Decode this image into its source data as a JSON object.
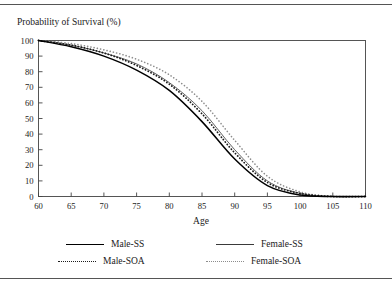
{
  "figure": {
    "title": "Probability of Survival (%)",
    "has_top_rule": true,
    "has_bottom_rule": true,
    "frame_color": "#555555"
  },
  "legend": {
    "position": "below-plot",
    "entries": [
      {
        "label": "Male-SS",
        "style": "solid-thick",
        "color": "#000000"
      },
      {
        "label": "Female-SS",
        "style": "solid-thin",
        "color": "#3a3a3a"
      },
      {
        "label": "Male-SOA",
        "style": "dotted-bold",
        "color": "#1c1c1c"
      },
      {
        "label": "Female-SOA",
        "style": "dotted-light",
        "color": "#8c8c8c"
      }
    ]
  },
  "chart_data": {
    "type": "line",
    "title": "Probability of Survival (%)",
    "xlabel": "Age",
    "ylabel": "Probability of Survival (%)",
    "xlim": [
      60,
      110
    ],
    "ylim": [
      0,
      100
    ],
    "xticks": [
      60,
      65,
      70,
      75,
      80,
      85,
      90,
      95,
      100,
      105,
      110
    ],
    "yticks": [
      0,
      10,
      20,
      30,
      40,
      50,
      60,
      70,
      80,
      90,
      100
    ],
    "grid": false,
    "legend_position": "bottom",
    "x": [
      60,
      65,
      70,
      75,
      80,
      85,
      90,
      95,
      100,
      105,
      110
    ],
    "series": [
      {
        "name": "Male-SS",
        "style": "solid-thick",
        "color": "#000000",
        "values": [
          100,
          96,
          90,
          81,
          68,
          48,
          24,
          7,
          1,
          0,
          0
        ]
      },
      {
        "name": "Female-SS",
        "style": "solid-thin",
        "color": "#3a3a3a",
        "values": [
          100,
          97,
          92,
          85,
          73,
          55,
          30,
          10,
          2,
          0,
          0
        ]
      },
      {
        "name": "Male-SOA",
        "style": "dotted-bold",
        "color": "#1c1c1c",
        "values": [
          100,
          97,
          92,
          84,
          72,
          53,
          28,
          9,
          2,
          0,
          0
        ]
      },
      {
        "name": "Female-SOA",
        "style": "dotted-light",
        "color": "#8c8c8c",
        "values": [
          100,
          98,
          94,
          88,
          78,
          61,
          36,
          13,
          3,
          0,
          0
        ]
      }
    ]
  }
}
